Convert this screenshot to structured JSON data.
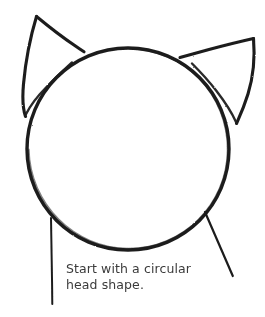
{
  "canvas": {
    "width": 265,
    "height": 317,
    "background_color": "#ffffff",
    "ink_color": "#1c1c1c"
  },
  "illustration": {
    "title": "cat-head-construction-step",
    "subject": "cat head outline",
    "style": "hand-drawn pencil sketch",
    "parts": [
      {
        "name": "head-circle",
        "shape": "circle",
        "center_x": 128,
        "center_y": 149,
        "radius": 101
      },
      {
        "name": "left-ear",
        "shape": "triangle",
        "tip_x": 36,
        "tip_y": 16
      },
      {
        "name": "right-ear",
        "shape": "triangle",
        "tip_x": 253,
        "tip_y": 38
      },
      {
        "name": "left-jaw-line",
        "shape": "line",
        "start_x": 51,
        "start_y": 218,
        "end_x": 52,
        "end_y": 305
      },
      {
        "name": "right-jaw-line",
        "shape": "line",
        "start_x": 205,
        "start_y": 212,
        "end_x": 233,
        "end_y": 276
      }
    ]
  },
  "caption": {
    "text": "Start with a circular\nhead shape.",
    "line_1": "Start with a circular",
    "line_2": "head shape.",
    "color": "#3b3b3b"
  }
}
